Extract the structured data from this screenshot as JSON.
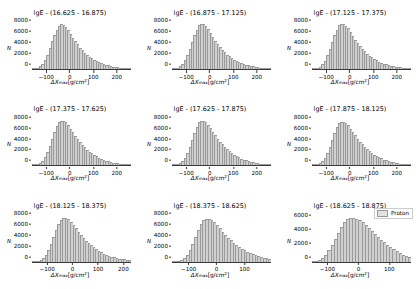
{
  "figure": {
    "rows": 3,
    "cols": 3,
    "background": "#ffffff",
    "bar_fill": "#d0d0d0",
    "bar_edge": "#9a9a9a",
    "axis_color": "#3a3a3a"
  },
  "axis": {
    "ylabel": "N",
    "xlabel_prefix": "ΔX",
    "xlabel_sub": "max",
    "xlabel_suffix": "[g/cm",
    "xlabel_sup": "2",
    "xlabel_end": "]"
  },
  "legend": {
    "label": "Proton",
    "swatch_color": "#e2e2e2",
    "position": "upper-right",
    "shown_in_panel": 9
  },
  "chart_data": {
    "type": "bar",
    "xlabel": "ΔXmax [g/cm^2]",
    "ylabel": "N",
    "grid": false,
    "legend_position": "upper right",
    "legend_entries": [
      "Proton"
    ],
    "bin_width": 10,
    "panels": [
      {
        "index": 1,
        "title": "lgE - (16.625 - 16.875)",
        "xlim": [
          -160,
          260
        ],
        "ylim": [
          0,
          9000
        ],
        "xticks": [
          -100,
          0,
          100,
          200
        ],
        "yticks": [
          0,
          2000,
          4000,
          6000,
          8000
        ],
        "peak_x": -40,
        "peak_y": 8400,
        "bin_centers": [
          -155,
          -145,
          -135,
          -125,
          -115,
          -105,
          -95,
          -85,
          -75,
          -65,
          -55,
          -45,
          -35,
          -25,
          -15,
          -5,
          5,
          15,
          25,
          35,
          45,
          55,
          65,
          75,
          85,
          95,
          105,
          115,
          125,
          135,
          145,
          155,
          165,
          175,
          185,
          195,
          205,
          215,
          225,
          235,
          245,
          255
        ],
        "values": [
          40,
          110,
          260,
          520,
          980,
          1700,
          2700,
          3900,
          5200,
          6400,
          7400,
          8100,
          8400,
          8300,
          7900,
          7300,
          6600,
          5900,
          5200,
          4600,
          4000,
          3500,
          3050,
          2650,
          2300,
          2000,
          1720,
          1480,
          1270,
          1080,
          920,
          780,
          660,
          555,
          465,
          390,
          325,
          270,
          222,
          182,
          148,
          118
        ]
      },
      {
        "index": 2,
        "title": "lgE - (16.875 - 17.125)",
        "xlim": [
          -160,
          260
        ],
        "ylim": [
          0,
          9000
        ],
        "xticks": [
          -100,
          0,
          100,
          200
        ],
        "yticks": [
          0,
          2000,
          4000,
          6000,
          8000
        ],
        "peak_x": -35,
        "peak_y": 8500,
        "bin_centers": [
          -155,
          -145,
          -135,
          -125,
          -115,
          -105,
          -95,
          -85,
          -75,
          -65,
          -55,
          -45,
          -35,
          -25,
          -15,
          -5,
          5,
          15,
          25,
          35,
          45,
          55,
          65,
          75,
          85,
          95,
          105,
          115,
          125,
          135,
          145,
          155,
          165,
          175,
          185,
          195,
          205,
          215,
          225,
          235,
          245,
          255
        ],
        "values": [
          35,
          100,
          240,
          490,
          930,
          1630,
          2620,
          3800,
          5100,
          6350,
          7400,
          8200,
          8500,
          8400,
          8050,
          7450,
          6750,
          6000,
          5300,
          4700,
          4100,
          3600,
          3130,
          2720,
          2360,
          2050,
          1770,
          1520,
          1305,
          1115,
          950,
          805,
          680,
          575,
          482,
          404,
          337,
          280,
          231,
          190,
          155,
          124
        ]
      },
      {
        "index": 3,
        "title": "lgE - (17.125 - 17.375)",
        "xlim": [
          -160,
          260
        ],
        "ylim": [
          0,
          9000
        ],
        "xticks": [
          -100,
          0,
          100,
          200
        ],
        "yticks": [
          0,
          2000,
          4000,
          6000,
          8000
        ],
        "peak_x": -30,
        "peak_y": 8500,
        "bin_centers": [
          -155,
          -145,
          -135,
          -125,
          -115,
          -105,
          -95,
          -85,
          -75,
          -65,
          -55,
          -45,
          -35,
          -25,
          -15,
          -5,
          5,
          15,
          25,
          35,
          45,
          55,
          65,
          75,
          85,
          95,
          105,
          115,
          125,
          135,
          145,
          155,
          165,
          175,
          185,
          195,
          205,
          215,
          225,
          235,
          245,
          255
        ],
        "values": [
          30,
          90,
          225,
          460,
          890,
          1570,
          2540,
          3720,
          5020,
          6300,
          7380,
          8200,
          8500,
          8450,
          8150,
          7600,
          6900,
          6200,
          5500,
          4880,
          4300,
          3780,
          3300,
          2880,
          2500,
          2170,
          1875,
          1615,
          1385,
          1185,
          1010,
          860,
          728,
          614,
          516,
          432,
          360,
          300,
          248,
          204,
          167,
          134
        ]
      },
      {
        "index": 4,
        "title": "lgE - (17.375 - 17.625)",
        "xlim": [
          -160,
          260
        ],
        "ylim": [
          0,
          9000
        ],
        "xticks": [
          -100,
          0,
          100,
          200
        ],
        "yticks": [
          0,
          2000,
          4000,
          6000,
          8000
        ],
        "peak_x": -30,
        "peak_y": 8400,
        "bin_centers": [
          -155,
          -145,
          -135,
          -125,
          -115,
          -105,
          -95,
          -85,
          -75,
          -65,
          -55,
          -45,
          -35,
          -25,
          -15,
          -5,
          5,
          15,
          25,
          35,
          45,
          55,
          65,
          75,
          85,
          95,
          105,
          115,
          125,
          135,
          145,
          155,
          165,
          175,
          185,
          195,
          205,
          215,
          225,
          235,
          245,
          255
        ],
        "values": [
          25,
          80,
          205,
          430,
          840,
          1500,
          2450,
          3620,
          4920,
          6200,
          7300,
          8120,
          8400,
          8380,
          8100,
          7580,
          6900,
          6220,
          5540,
          4920,
          4350,
          3840,
          3370,
          2945,
          2560,
          2225,
          1925,
          1660,
          1425,
          1220,
          1040,
          885,
          750,
          633,
          532,
          446,
          372,
          310,
          256,
          211,
          173,
          139
        ]
      },
      {
        "index": 5,
        "title": "lgE - (17.625 - 17.875)",
        "xlim": [
          -160,
          260
        ],
        "ylim": [
          0,
          9000
        ],
        "xticks": [
          -100,
          0,
          100,
          200
        ],
        "yticks": [
          0,
          2000,
          4000,
          6000,
          8000
        ],
        "peak_x": -25,
        "peak_y": 8300,
        "bin_centers": [
          -155,
          -145,
          -135,
          -125,
          -115,
          -105,
          -95,
          -85,
          -75,
          -65,
          -55,
          -45,
          -35,
          -25,
          -15,
          -5,
          5,
          15,
          25,
          35,
          45,
          55,
          65,
          75,
          85,
          95,
          105,
          115,
          125,
          135,
          145,
          155,
          165,
          175,
          185,
          195,
          205,
          215,
          225,
          235,
          245,
          255
        ],
        "values": [
          20,
          70,
          185,
          395,
          790,
          1430,
          2360,
          3520,
          4820,
          6120,
          7220,
          8050,
          8300,
          8300,
          8060,
          7570,
          6920,
          6260,
          5600,
          4990,
          4420,
          3910,
          3440,
          3015,
          2630,
          2290,
          1985,
          1715,
          1475,
          1265,
          1080,
          920,
          782,
          661,
          556,
          467,
          390,
          325,
          269,
          222,
          182,
          146
        ]
      },
      {
        "index": 6,
        "title": "lgE - (17.875 - 18.125)",
        "xlim": [
          -160,
          260
        ],
        "ylim": [
          0,
          9000
        ],
        "xticks": [
          -100,
          0,
          100,
          200
        ],
        "yticks": [
          0,
          2000,
          4000,
          6000,
          8000
        ],
        "peak_x": -25,
        "peak_y": 8200,
        "bin_centers": [
          -155,
          -145,
          -135,
          -125,
          -115,
          -105,
          -95,
          -85,
          -75,
          -65,
          -55,
          -45,
          -35,
          -25,
          -15,
          -5,
          5,
          15,
          25,
          35,
          45,
          55,
          65,
          75,
          85,
          95,
          105,
          115,
          125,
          135,
          145,
          155,
          165,
          175,
          185,
          195,
          205,
          215,
          225,
          235,
          245,
          255
        ],
        "values": [
          18,
          62,
          170,
          370,
          750,
          1375,
          2290,
          3440,
          4740,
          6040,
          7140,
          7970,
          8200,
          8220,
          8000,
          7530,
          6900,
          6250,
          5600,
          5000,
          4440,
          3930,
          3470,
          3045,
          2660,
          2320,
          2010,
          1740,
          1495,
          1285,
          1095,
          935,
          795,
          672,
          566,
          475,
          397,
          331,
          274,
          226,
          185,
          149
        ]
      },
      {
        "index": 7,
        "title": "lgE - (18.125 - 18.375)",
        "xlim": [
          -160,
          230
        ],
        "ylim": [
          0,
          9000
        ],
        "xticks": [
          -100,
          0,
          100,
          200
        ],
        "yticks": [
          0,
          2000,
          4000,
          6000,
          8000
        ],
        "peak_x": -25,
        "peak_y": 8100,
        "bin_centers": [
          -155,
          -145,
          -135,
          -125,
          -115,
          -105,
          -95,
          -85,
          -75,
          -65,
          -55,
          -45,
          -35,
          -25,
          -15,
          -5,
          5,
          15,
          25,
          35,
          45,
          55,
          65,
          75,
          85,
          95,
          105,
          115,
          125,
          135,
          145,
          155,
          165,
          175,
          185,
          195,
          205,
          215,
          225
        ],
        "values": [
          15,
          55,
          158,
          350,
          720,
          1330,
          2230,
          3370,
          4670,
          5970,
          7070,
          7900,
          8100,
          8130,
          7930,
          7480,
          6870,
          6240,
          5600,
          5010,
          4460,
          3960,
          3500,
          3080,
          2700,
          2360,
          2050,
          1780,
          1530,
          1320,
          1130,
          965,
          822,
          697,
          588,
          495,
          415,
          346,
          288
        ]
      },
      {
        "index": 8,
        "title": "lgE - (18.375 - 18.625)",
        "xlim": [
          -160,
          195
        ],
        "ylim": [
          0,
          9000
        ],
        "xticks": [
          -100,
          0,
          100
        ],
        "yticks": [
          0,
          2000,
          4000,
          6000,
          8000
        ],
        "peak_x": -25,
        "peak_y": 8000,
        "bin_centers": [
          -155,
          -145,
          -135,
          -125,
          -115,
          -105,
          -95,
          -85,
          -75,
          -65,
          -55,
          -45,
          -35,
          -25,
          -15,
          -5,
          5,
          15,
          25,
          35,
          45,
          55,
          65,
          75,
          85,
          95,
          105,
          115,
          125,
          135,
          145,
          155,
          165,
          175,
          185,
          195
        ],
        "values": [
          12,
          48,
          145,
          330,
          690,
          1290,
          2180,
          3310,
          4610,
          5900,
          7000,
          7820,
          8000,
          8040,
          7860,
          7430,
          6840,
          6220,
          5600,
          5020,
          4480,
          3990,
          3540,
          3130,
          2750,
          2410,
          2100,
          1830,
          1580,
          1365,
          1170,
          1000,
          855,
          727,
          615,
          520
        ]
      },
      {
        "index": 9,
        "title": "lgE - (18.625 - 18.875)",
        "xlim": [
          -150,
          170
        ],
        "ylim": [
          0,
          7000
        ],
        "xticks": [
          -100,
          0,
          100
        ],
        "yticks": [
          0,
          2000,
          4000,
          6000
        ],
        "peak_x": -15,
        "peak_y": 6400,
        "bin_centers": [
          -145,
          -135,
          -125,
          -115,
          -105,
          -95,
          -85,
          -75,
          -65,
          -55,
          -45,
          -35,
          -25,
          -15,
          -5,
          5,
          15,
          25,
          35,
          45,
          55,
          65,
          75,
          85,
          95,
          105,
          115,
          125,
          135,
          145,
          155,
          165
        ],
        "values": [
          30,
          95,
          245,
          530,
          1000,
          1640,
          2440,
          3320,
          4220,
          5060,
          5740,
          6180,
          6380,
          6400,
          6290,
          6060,
          5740,
          5360,
          4940,
          4500,
          4060,
          3620,
          3200,
          2800,
          2430,
          2090,
          1780,
          1500,
          1255,
          1040,
          855,
          700
        ]
      }
    ]
  }
}
